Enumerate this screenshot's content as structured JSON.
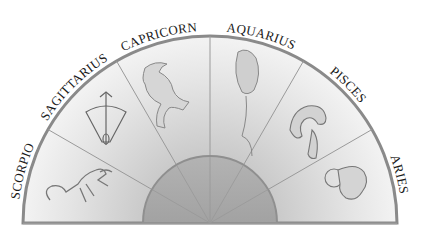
{
  "diagram": {
    "type": "zodiac-semicircle",
    "sectors": [
      {
        "label": "SCORPIO",
        "icon": "scorpion-icon"
      },
      {
        "label": "SAGITTARIUS",
        "icon": "bow-and-arrow-icon"
      },
      {
        "label": "CAPRICORN",
        "icon": "sea-goat-icon"
      },
      {
        "label": "AQUARIUS",
        "icon": "water-jar-icon"
      },
      {
        "label": "PISCES",
        "icon": "fish-icon"
      },
      {
        "label": "ARIES",
        "icon": "ram-icon"
      }
    ],
    "colors": {
      "sector_light": "#efefef",
      "sector_dark": "#c8c8c8",
      "rim": "#8a8a8a",
      "inner_disc": "#a9a9a9",
      "text": "#1a1a1a"
    }
  }
}
